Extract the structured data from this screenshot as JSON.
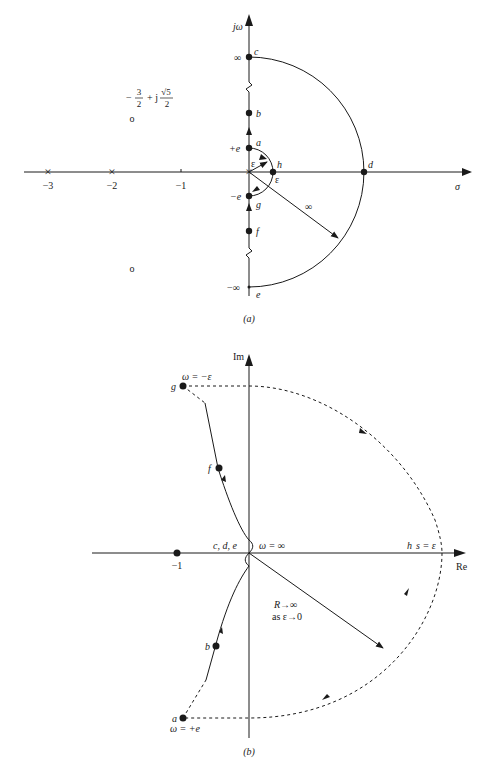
{
  "figure_a": {
    "caption": "(a)",
    "y_axis_label": "jω",
    "x_axis_label": "σ",
    "x_ticks": [
      "−3",
      "−2",
      "−1"
    ],
    "zero_label_num": "3",
    "zero_label_den": "2",
    "zero_label_prefix": "−",
    "zero_label_mid": "+ j",
    "zero_label_sqrt": "√5",
    "zero_label_den2": "2",
    "zero_marker": "o",
    "pole_marker": "×",
    "infinity_top": "∞",
    "infinity_bottom": "−∞",
    "plus_e": "+e",
    "minus_e": "−e",
    "epsilon": "ε",
    "radius_label": "∞",
    "points": {
      "a": "a",
      "b": "b",
      "c": "c",
      "d": "d",
      "e": "e",
      "f": "f",
      "g": "g",
      "h": "h"
    }
  },
  "figure_b": {
    "caption": "(b)",
    "y_axis_label": "Im",
    "x_axis_label": "Re",
    "minus_one": "−1",
    "cde_label": "c, d, e",
    "omega_inf": "ω = ∞",
    "h_label": "h",
    "s_eps": "s = ε",
    "omega_minus_eps": "ω = −ε",
    "omega_plus_e": "ω = +e",
    "r_label": "R→∞",
    "as_label": "as ε→0",
    "points": {
      "a": "a",
      "b": "b",
      "f": "f",
      "g": "g"
    }
  }
}
